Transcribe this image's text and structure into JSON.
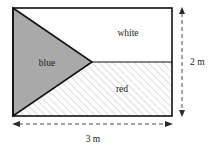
{
  "figure": {
    "shape": "rectangle",
    "regions": [
      {
        "id": "blue",
        "label": "blue",
        "fill_style": "solid-gray",
        "color": "#a9a9a9",
        "label_x": 47,
        "label_y": 66
      },
      {
        "id": "white",
        "label": "white",
        "fill_style": "plain-white",
        "color": "#ffffff",
        "label_x": 128,
        "label_y": 36
      },
      {
        "id": "red",
        "label": "red",
        "fill_style": "diagonal-hatch",
        "color": "#ffffff",
        "label_x": 122,
        "label_y": 92
      }
    ],
    "dimensions": [
      {
        "id": "height",
        "label": "2 m",
        "orientation": "vertical",
        "value": 2,
        "unit": "m",
        "label_x": 195,
        "label_y": 65
      },
      {
        "id": "width",
        "label": "3 m",
        "orientation": "horizontal",
        "value": 3,
        "unit": "m",
        "label_x": 93,
        "label_y": 141
      }
    ],
    "geometry": {
      "rect_left": 13,
      "rect_top": 8,
      "rect_right": 172,
      "rect_bottom": 116,
      "apex_x": 92,
      "apex_y": 62
    },
    "colors": {
      "outline": "#111111",
      "gray_fill": "#a9a9a9",
      "hatch": "#c9c9c9",
      "dim_line": "#4a4a4a",
      "text": "#1a1a1a"
    }
  }
}
